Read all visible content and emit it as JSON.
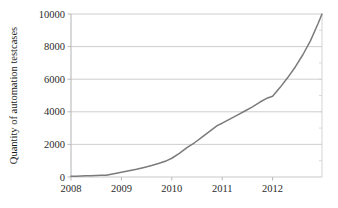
{
  "chart_data": {
    "type": "line",
    "title": "",
    "xlabel": "",
    "ylabel": "Quantity of automation testcases",
    "xlim": [
      2008.0,
      2012.98
    ],
    "ylim": [
      0,
      10000
    ],
    "grid": true,
    "legend": null,
    "legend_position": "none",
    "line_color": "#7b7b7b",
    "axis_color": "#b9b9b9",
    "grid_color": "#c8c8c8",
    "xticks": [
      2008,
      2009,
      2010,
      2011,
      2012
    ],
    "xtick_labels": [
      "2008",
      "2009",
      "2010",
      "2011",
      "2012"
    ],
    "yticks": [
      0,
      2000,
      4000,
      6000,
      8000,
      10000
    ],
    "ytick_labels": [
      "0",
      "2000",
      "4000",
      "6000",
      "8000",
      "10000"
    ],
    "series": [
      {
        "name": "Quantity of automation testcases",
        "x": [
          2008.0,
          2008.1,
          2008.2,
          2008.3,
          2008.4,
          2008.5,
          2008.6,
          2008.7,
          2008.8,
          2008.9,
          2009.0,
          2009.15,
          2009.3,
          2009.45,
          2009.6,
          2009.75,
          2009.9,
          2010.0,
          2010.15,
          2010.3,
          2010.45,
          2010.6,
          2010.75,
          2010.9,
          2011.0,
          2011.15,
          2011.3,
          2011.45,
          2011.6,
          2011.75,
          2011.9,
          2012.0,
          2012.15,
          2012.3,
          2012.45,
          2012.6,
          2012.75,
          2012.9,
          2012.98
        ],
        "values": [
          40,
          50,
          60,
          70,
          80,
          90,
          100,
          110,
          170,
          230,
          290,
          380,
          470,
          580,
          700,
          840,
          1000,
          1150,
          1450,
          1800,
          2100,
          2450,
          2800,
          3150,
          3300,
          3550,
          3800,
          4050,
          4300,
          4600,
          4850,
          4950,
          5500,
          6100,
          6750,
          7500,
          8350,
          9400,
          10000
        ]
      }
    ],
    "annotations": []
  }
}
